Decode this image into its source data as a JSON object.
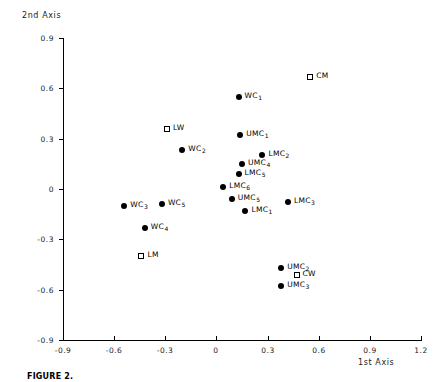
{
  "chart_data": {
    "type": "scatter",
    "title": "",
    "xlabel": "1st Axis",
    "ylabel": "2nd Axis",
    "xlim": [
      -0.9,
      1.2
    ],
    "ylim": [
      -0.9,
      0.9
    ],
    "xticks": [
      "-0.9",
      "-0.6",
      "-0.3",
      "0",
      "0.3",
      "0.6",
      "0.9",
      "1.2"
    ],
    "xtick_values": [
      -0.9,
      -0.6,
      -0.3,
      0,
      0.3,
      0.6,
      0.9,
      1.2
    ],
    "yticks": [
      "0.9",
      "0.6",
      "0.3",
      "0",
      "-0.3",
      "-0.6",
      "-0.9"
    ],
    "ytick_values": [
      0.9,
      0.6,
      0.3,
      0,
      -0.3,
      -0.6,
      -0.9
    ],
    "grid": false,
    "legend": "none",
    "series": [
      {
        "name": "filled",
        "marker": "filled-circle",
        "points": [
          {
            "label": "WC",
            "sub": "1",
            "x": 0.13,
            "y": 0.55
          },
          {
            "label": "WC",
            "sub": "2",
            "x": -0.2,
            "y": 0.23
          },
          {
            "label": "UMC",
            "sub": "1",
            "x": 0.14,
            "y": 0.32
          },
          {
            "label": "LMC",
            "sub": "2",
            "x": 0.27,
            "y": 0.2
          },
          {
            "label": "UMC",
            "sub": "4",
            "x": 0.15,
            "y": 0.15
          },
          {
            "label": "LMC",
            "sub": "5",
            "x": 0.13,
            "y": 0.09
          },
          {
            "label": "LMC",
            "sub": "6",
            "x": 0.04,
            "y": 0.01
          },
          {
            "label": "UMC",
            "sub": "5",
            "x": 0.09,
            "y": -0.06
          },
          {
            "label": "LMC",
            "sub": "1",
            "x": 0.17,
            "y": -0.13
          },
          {
            "label": "LMC",
            "sub": "3",
            "x": 0.42,
            "y": -0.08
          },
          {
            "label": "WC",
            "sub": "3",
            "x": -0.54,
            "y": -0.1
          },
          {
            "label": "WC",
            "sub": "5",
            "x": -0.32,
            "y": -0.09
          },
          {
            "label": "WC",
            "sub": "4",
            "x": -0.42,
            "y": -0.23
          },
          {
            "label": "UMC",
            "sub": "2",
            "x": 0.38,
            "y": -0.47
          },
          {
            "label": "UMC",
            "sub": "3",
            "x": 0.38,
            "y": -0.58
          }
        ]
      },
      {
        "name": "open",
        "marker": "open-square",
        "points": [
          {
            "label": "CM",
            "sub": "",
            "x": 0.55,
            "y": 0.67
          },
          {
            "label": "LW",
            "sub": "",
            "x": -0.29,
            "y": 0.36
          },
          {
            "label": "LM",
            "sub": "",
            "x": -0.44,
            "y": -0.4
          },
          {
            "label": "CW",
            "sub": "",
            "x": 0.47,
            "y": -0.51
          }
        ]
      }
    ]
  },
  "caption": "FIGURE 2.",
  "axes": {
    "x_title": "1st Axis",
    "y_title": "2nd Axis"
  }
}
